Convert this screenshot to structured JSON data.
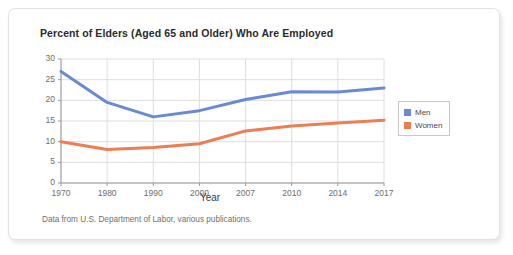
{
  "card": {
    "source_note": "Data from U.S. Department of Labor, various publications."
  },
  "chart_data": {
    "type": "line",
    "title": "Percent of Elders (Aged 65 and Older) Who Are Employed",
    "xlabel": "Year",
    "ylabel": "",
    "categories": [
      "1970",
      "1980",
      "1990",
      "2000",
      "2007",
      "2010",
      "2014",
      "2017"
    ],
    "x_tick_labels": [
      "1970",
      "1980",
      "1990",
      "2000",
      "2007",
      "2010",
      "2014",
      "2017"
    ],
    "y_tick_labels": [
      "0",
      "5",
      "10",
      "15",
      "20",
      "25",
      "30"
    ],
    "ylim": [
      0,
      30
    ],
    "y_step": 5,
    "grid": true,
    "legend_position": "right",
    "series": [
      {
        "name": "Men",
        "color": "#6a8ad4",
        "values": [
          27.0,
          19.5,
          16.0,
          17.5,
          20.2,
          22.1,
          22.0,
          23.0
        ]
      },
      {
        "name": "Women",
        "color": "#ed7d52",
        "values": [
          10.0,
          8.1,
          8.6,
          9.5,
          12.6,
          13.8,
          14.5,
          15.2
        ]
      }
    ]
  }
}
